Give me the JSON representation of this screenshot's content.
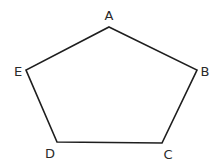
{
  "diagram": {
    "shape": "pentagon",
    "stroke_color": "#1e1e1e",
    "label_color": "#2a2a2a",
    "background": "#ffffff",
    "vertices": [
      {
        "label": "A",
        "x": 109,
        "y": 27,
        "label_x": 109,
        "label_y": 20
      },
      {
        "label": "B",
        "x": 197,
        "y": 70,
        "label_x": 205,
        "label_y": 76
      },
      {
        "label": "C",
        "x": 162,
        "y": 143,
        "label_x": 168,
        "label_y": 159
      },
      {
        "label": "D",
        "x": 57,
        "y": 142,
        "label_x": 50,
        "label_y": 158
      },
      {
        "label": "E",
        "x": 26,
        "y": 70,
        "label_x": 18,
        "label_y": 76
      }
    ],
    "edges": [
      [
        "A",
        "B"
      ],
      [
        "B",
        "C"
      ],
      [
        "C",
        "D"
      ],
      [
        "D",
        "E"
      ],
      [
        "E",
        "A"
      ]
    ]
  }
}
